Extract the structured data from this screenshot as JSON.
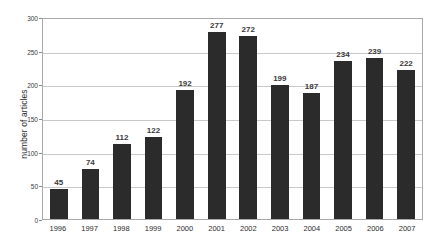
{
  "chart_data": {
    "type": "bar",
    "title": "",
    "xlabel": "",
    "ylabel": "number of articles",
    "categories": [
      "1996",
      "1997",
      "1998",
      "1999",
      "2000",
      "2001",
      "2002",
      "2003",
      "2004",
      "2005",
      "2006",
      "2007"
    ],
    "values": [
      45,
      74,
      112,
      122,
      192,
      277,
      272,
      199,
      187,
      234,
      239,
      222
    ],
    "ylim": [
      0,
      300
    ],
    "ytick_values": [
      300,
      250,
      200,
      150,
      100,
      50,
      0
    ],
    "ytick_labels": [
      "300",
      "250",
      "200",
      "150",
      "100",
      "50",
      "0"
    ],
    "grid": "horizontal",
    "legend": "none",
    "data_labels": [
      "45",
      "74",
      "112",
      "122",
      "192",
      "277",
      "272",
      "199",
      "187",
      "234",
      "239",
      "222"
    ],
    "bar_color": "#2b2b2b",
    "gridline_color": "#c9c9c9",
    "plot_border_color": "#a9a9a9",
    "background_color": "#ffffff"
  }
}
